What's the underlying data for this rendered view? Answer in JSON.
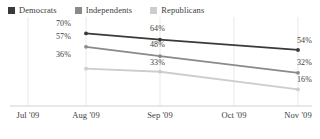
{
  "legend": {
    "items": [
      {
        "label": "Democrats",
        "color": "#3a3a3a",
        "swatch_icon": "square-swatch-icon"
      },
      {
        "label": "Independents",
        "color": "#8a8a8a",
        "swatch_icon": "square-swatch-icon"
      },
      {
        "label": "Republicans",
        "color": "#cdcdcd",
        "swatch_icon": "square-swatch-icon"
      }
    ]
  },
  "axis": {
    "x_tick_labels": [
      "Jul '09",
      "Aug '09",
      "Sep '09",
      "Oct '09",
      "Nov '09"
    ]
  },
  "labels": {
    "dem_1": "70%",
    "dem_2": "64%",
    "dem_3": "54%",
    "ind_1": "57%",
    "ind_2": "48%",
    "ind_3": "32%",
    "rep_1": "36%",
    "rep_2": "33%",
    "rep_3": "16%"
  },
  "chart_data": {
    "type": "line",
    "title": "",
    "subtitle": "",
    "xlabel": "",
    "ylabel": "",
    "x": [
      "Jul '09",
      "Aug '09",
      "Sep '09",
      "Oct '09",
      "Nov '09"
    ],
    "x_tick_labels": [
      "Jul '09",
      "Aug '09",
      "Sep '09",
      "Oct '09",
      "Nov '09"
    ],
    "series": [
      {
        "name": "Democrats",
        "color": "#3a3a3a",
        "x": [
          "Aug '09",
          "Sep '09",
          "Nov '09"
        ],
        "values": [
          70,
          64,
          54
        ],
        "data_labels": [
          "70%",
          "64%",
          "54%"
        ]
      },
      {
        "name": "Independents",
        "color": "#8a8a8a",
        "x": [
          "Aug '09",
          "Sep '09",
          "Nov '09"
        ],
        "values": [
          57,
          48,
          32
        ],
        "data_labels": [
          "57%",
          "48%",
          "32%"
        ]
      },
      {
        "name": "Republicans",
        "color": "#cdcdcd",
        "x": [
          "Aug '09",
          "Sep '09",
          "Nov '09"
        ],
        "values": [
          36,
          33,
          16
        ],
        "data_labels": [
          "36%",
          "33%",
          "16%"
        ]
      }
    ],
    "ylim": [
      0,
      80
    ],
    "grid": {
      "vertical": true,
      "horizontal": false
    },
    "legend_position": "top-left",
    "units": "percent"
  }
}
